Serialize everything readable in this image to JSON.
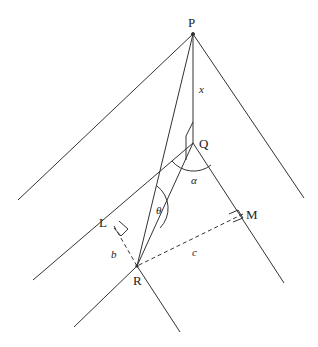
{
  "diagram": {
    "type": "geometry-construction",
    "points": {
      "P": {
        "label": "P",
        "x": 193,
        "y": 34
      },
      "Q": {
        "label": "Q",
        "x": 193,
        "y": 143
      },
      "R": {
        "label": "R",
        "x": 137,
        "y": 266
      },
      "L": {
        "label": "L",
        "x": 114,
        "y": 226
      },
      "M": {
        "label": "M",
        "x": 243,
        "y": 214
      }
    },
    "variables": {
      "x": "x",
      "alpha": "α",
      "theta": "θ",
      "b": "b",
      "c": "c"
    },
    "colors": {
      "line": "#333333",
      "background": "#ffffff"
    }
  }
}
